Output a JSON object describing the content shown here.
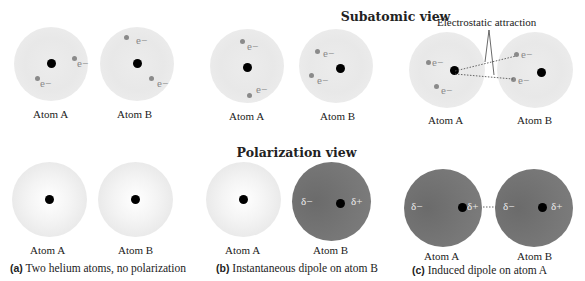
{
  "titles": {
    "subatomic": "Subatomic view",
    "polarization": "Polarization view"
  },
  "annotation": "Electrostatic attraction",
  "atom_labels": {
    "a": "Atom A",
    "b": "Atom B"
  },
  "symbols": {
    "electron": "e−",
    "delta_minus": "δ−",
    "delta_plus": "δ+"
  },
  "panels": [
    {
      "letter": "(a)",
      "caption": "Two helium atoms, no polarization"
    },
    {
      "letter": "(b)",
      "caption": "Instantaneous dipole on atom B"
    },
    {
      "letter": "(c)",
      "caption": "Induced dipole on atom A"
    }
  ],
  "colors": {
    "nucleus": "#000000",
    "electron": "#8a8a8a",
    "polarized_atom": "#777777",
    "neutral_atom": "#e6e6e6"
  }
}
